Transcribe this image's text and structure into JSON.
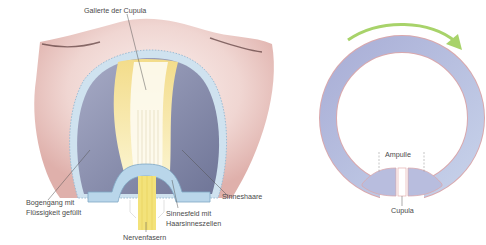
{
  "left_figure": {
    "title": "Ampulla cross-section",
    "labels": {
      "cupula_gel": "Gallerte der Cupula",
      "canal_line1": "Bogengang mit",
      "canal_line2": "Flüssigkeit gefüllt",
      "sensory_hairs": "Sinneshaare",
      "sensory_field_line1": "Sinnesfeld mit",
      "sensory_field_line2": "Haarsinneszellen",
      "nerve_fibers": "Nervenfasern"
    }
  },
  "right_figure": {
    "title": "Semicircular canal ring",
    "labels": {
      "ampulla": "Ampulle",
      "cupula": "Cupula"
    },
    "arrow_direction": "clockwise"
  },
  "colors": {
    "tissue_pink": "#e9c9c4",
    "canal_fluid": "#8a8fb0",
    "epithelium_blue": "#b9d6ea",
    "cupula_yellow": "#efd77a",
    "nerve_yellow": "#f3e27a",
    "ring_fill": "#b8bdde",
    "ring_outline": "#d9a8ad",
    "arrow_green": "#a8d36a",
    "label_text": "#4a4a4a"
  }
}
